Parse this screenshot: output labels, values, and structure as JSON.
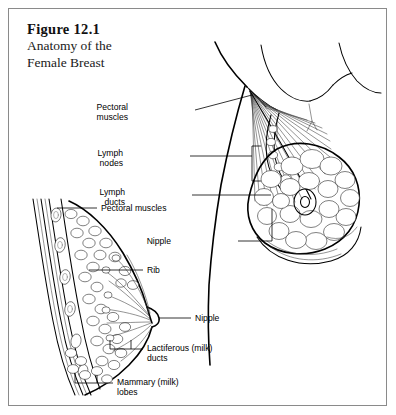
{
  "figure": {
    "number": "Figure 12.1",
    "caption_lines": [
      "Anatomy of the",
      "Female Breast"
    ],
    "border_color": "#8a8a8a",
    "background": "#ffffff",
    "ink_color": "#000000"
  },
  "labels": {
    "right_view": [
      {
        "id": "pectoral-muscles",
        "lines": [
          "Pectoral",
          "muscles"
        ]
      },
      {
        "id": "lymph-nodes",
        "lines": [
          "Lymph",
          "nodes"
        ]
      },
      {
        "id": "lymph-ducts",
        "lines": [
          "Lymph",
          "ducts"
        ]
      },
      {
        "id": "nipple",
        "lines": [
          "Nipple"
        ]
      }
    ],
    "cross_section": [
      {
        "id": "pectoral-muscles-cs",
        "lines": [
          "Pectoral muscles"
        ]
      },
      {
        "id": "rib",
        "lines": [
          "Rib"
        ]
      },
      {
        "id": "nipple-cs",
        "lines": [
          "Nipple"
        ]
      },
      {
        "id": "lactiferous-ducts",
        "lines": [
          "Lactiferous (milk)",
          "ducts"
        ]
      },
      {
        "id": "mammary-lobes",
        "lines": [
          "Mammary (milk)",
          "lobes"
        ]
      }
    ]
  },
  "views": {
    "cross_section_name": "sagittal-cross-section-of-breast",
    "anterior_name": "anterior-cutaway-view-of-breast"
  }
}
